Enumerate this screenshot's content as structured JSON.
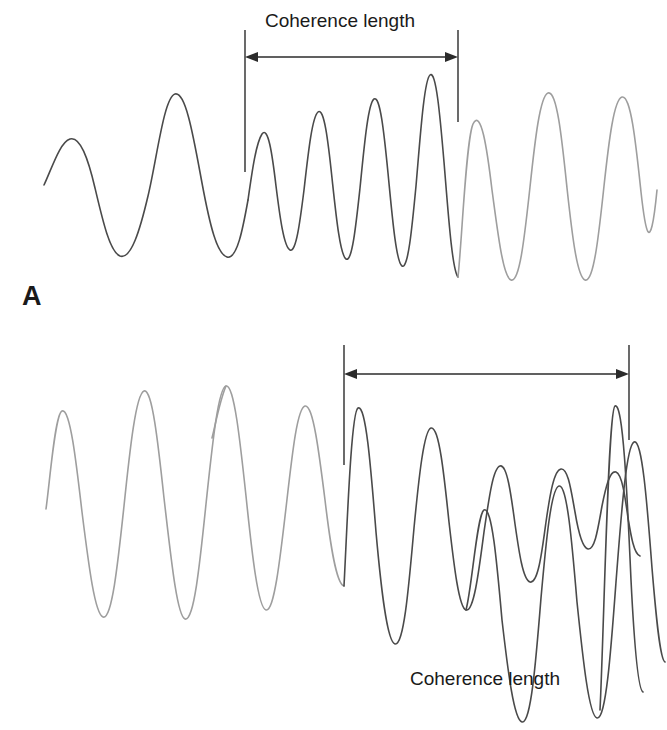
{
  "figure": {
    "background": "#ffffff",
    "width": 667,
    "height": 730,
    "stroke_dark": "#4a4a4a",
    "stroke_grey": "#9e9e9e",
    "stroke_marker": "#2b2b2b"
  },
  "panels": [
    {
      "id": "A",
      "letter": "A",
      "annotation_label": "Coherence length",
      "marker_left_x": 245,
      "marker_right_x": 458,
      "description": "wave train whose frequency and amplitude rise inside the coherent region"
    },
    {
      "id": "B",
      "letter": "B",
      "annotation_label": "Coherence length",
      "marker_left_x": 344,
      "marker_right_x": 629,
      "description": "beating wave train with amplitude node inside the coherent region"
    }
  ],
  "chart_data": {
    "type": "line",
    "title": "",
    "xlabel": "",
    "ylabel": "",
    "grid": false,
    "legend": "none",
    "annotations": [
      {
        "panel": "A",
        "text": "Coherence length",
        "arrow": "double-headed",
        "x_start": 245,
        "x_end": 458,
        "y": 57
      },
      {
        "panel": "B",
        "text": "Coherence length",
        "arrow": "double-headed",
        "x_start": 344,
        "x_end": 629,
        "y": 374
      }
    ],
    "series": [
      {
        "name": "A-incoherent-left",
        "panel": "A",
        "color": "#4a4a4a",
        "x_range": [
          44,
          245
        ],
        "note": "low frequency, moderate amplitude"
      },
      {
        "name": "A-coherent",
        "panel": "A",
        "color": "#4a4a4a",
        "x_range": [
          245,
          458
        ],
        "note": "high frequency, amplitude peaks near centre"
      },
      {
        "name": "A-incoherent-right",
        "panel": "A",
        "color": "#9e9e9e",
        "x_range": [
          458,
          662
        ],
        "note": "medium frequency, steady amplitude"
      },
      {
        "name": "B-incoherent-left",
        "panel": "B",
        "color": "#9e9e9e",
        "x_range": [
          44,
          344
        ],
        "note": "large amplitude oscillations collapsing into a beat node"
      },
      {
        "name": "B-coherent",
        "panel": "B",
        "color": "#4a4a4a",
        "x_range": [
          344,
          629
        ],
        "note": "full beat envelope with central node, amplitude grows to right edge"
      }
    ]
  }
}
